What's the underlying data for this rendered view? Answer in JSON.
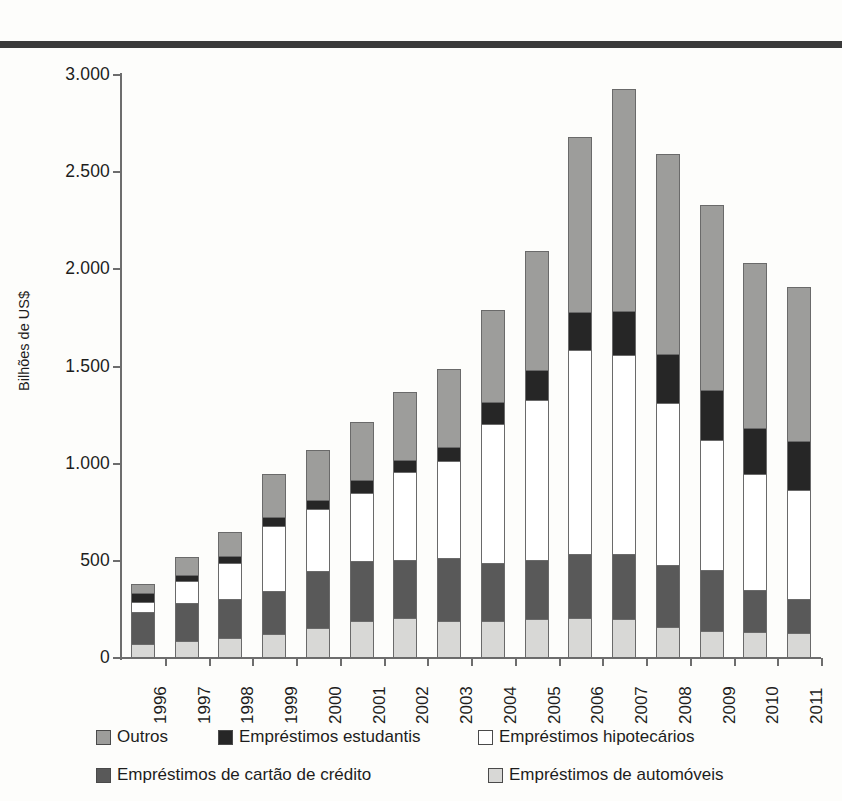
{
  "chart_data": {
    "type": "bar",
    "stacked": true,
    "title": "",
    "xlabel": "",
    "ylabel": "Bilhões de US$",
    "ylim": [
      0,
      3000
    ],
    "ytick_labels": [
      "3.000",
      "2.500",
      "2.000",
      "1.500",
      "1.000",
      "500",
      "0"
    ],
    "ytick_values": [
      3000,
      2500,
      2000,
      1500,
      1000,
      500,
      0
    ],
    "grid": false,
    "legend_position": "bottom",
    "categories": [
      "1996",
      "1997",
      "1998",
      "1999",
      "2000",
      "2001",
      "2002",
      "2003",
      "2004",
      "2005",
      "2006",
      "2007",
      "2008",
      "2009",
      "2010",
      "2011"
    ],
    "series": [
      {
        "name": "Empréstimos de automóveis",
        "color": "#d8d8d6",
        "stack_order": 1,
        "values": [
          60,
          75,
          95,
          115,
          145,
          180,
          195,
          180,
          180,
          190,
          195,
          190,
          150,
          130,
          125,
          120
        ]
      },
      {
        "name": "Empréstimos de cartão de crédito",
        "color": "#595959",
        "stack_order": 2,
        "values": [
          165,
          200,
          200,
          220,
          290,
          310,
          300,
          325,
          300,
          305,
          330,
          335,
          320,
          315,
          215,
          175
        ]
      },
      {
        "name": "Empréstimos hipotecários",
        "color": "#ffffff",
        "stack_order": 3,
        "values": [
          55,
          110,
          185,
          335,
          320,
          350,
          450,
          500,
          715,
          825,
          1050,
          1025,
          830,
          665,
          595,
          560
        ]
      },
      {
        "name": "Empréstimos estudantis",
        "color": "#262626",
        "stack_order": 4,
        "values": [
          45,
          30,
          35,
          45,
          50,
          65,
          65,
          70,
          110,
          150,
          195,
          225,
          255,
          260,
          240,
          250
        ]
      },
      {
        "name": "Outros",
        "color": "#9d9d9b",
        "stack_order": 5,
        "values": [
          45,
          95,
          125,
          220,
          255,
          300,
          350,
          400,
          475,
          615,
          900,
          1145,
          1030,
          950,
          850,
          795
        ]
      }
    ],
    "totals": [
      370,
      510,
      640,
      935,
      1060,
      1205,
      1360,
      1475,
      1780,
      2085,
      2670,
      2920,
      2585,
      2320,
      2025,
      1900
    ]
  },
  "legend": {
    "rows": [
      [
        {
          "label": "Outros",
          "swatch": "sw-other"
        },
        {
          "label": "Empréstimos estudantis",
          "swatch": "sw-student"
        },
        {
          "label": "Empréstimos hipotecários",
          "swatch": "sw-mortgage"
        }
      ],
      [
        {
          "label": "Empréstimos de cartão de crédito",
          "swatch": "sw-card"
        },
        {
          "label": "Empréstimos de automóveis",
          "swatch": "sw-auto"
        }
      ]
    ]
  }
}
